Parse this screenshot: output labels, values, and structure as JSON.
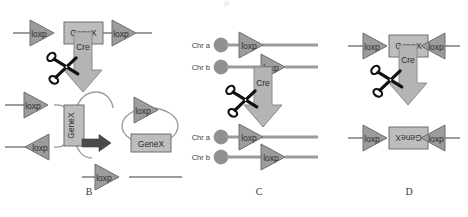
{
  "figure": {
    "colors": {
      "triangle_fill": "#9c9c9c",
      "triangle_stroke": "#6e6e6e",
      "box_fill": "#bdbdbd",
      "box_stroke": "#6e6e6e",
      "arrow_fill": "#b4b4b4",
      "arrow_stroke": "#8a8a8a",
      "dna_line": "#9c9c9c",
      "centromere_fill": "#8f8f8f",
      "thick_arrow_fill": "#4a4a4a",
      "scissors": "#111111",
      "label_text": "#3a3a3a",
      "element_text": "#2e2e2e",
      "circle_outline": "#8a8a8a"
    },
    "top_partial_mark": "µ"
  },
  "panels": [
    {
      "id": "B",
      "label": "B",
      "caption": "B",
      "mechanism": "excision",
      "description": "Two loxP sites in the same orientation on one DNA molecule; Cre excises the intervening GeneX as a circle",
      "substrate": {
        "loxp_left": "loxp",
        "gene": "GeneX",
        "loxp_right": "loxp"
      },
      "enzyme": {
        "name": "Cre",
        "icon": "scissors-icon"
      },
      "products": {
        "synapse_loxp_upper": "loxp",
        "synapse_loxp_lower": "loxp",
        "synapse_gene": "GeneX",
        "circle_loxp": "loxp",
        "circle_gene": "GeneX",
        "residual_loxp": "loxp"
      }
    },
    {
      "id": "C",
      "label": "C",
      "caption": "C",
      "mechanism": "translocation",
      "description": "loxP sites on two different chromosomes; Cre catalyses a reciprocal translocation between Chr a and Chr b",
      "substrate": {
        "chr_a_label": "Chr a",
        "chr_b_label": "Chr b",
        "chr_a_loxp": "loxp",
        "chr_b_loxp": "loxp"
      },
      "enzyme": {
        "name": "Cre",
        "icon": "scissors-icon"
      },
      "products": {
        "chr_a_label": "Chr a",
        "chr_b_label": "Chr b",
        "chr_a_loxp": "loxp",
        "chr_b_loxp": "loxp"
      }
    },
    {
      "id": "D",
      "label": "D",
      "caption": "D",
      "mechanism": "inversion",
      "description": "Two loxP sites in opposite orientation; Cre inverts the intervening GeneX segment",
      "substrate": {
        "loxp_left": "loxp",
        "gene": "GeneX",
        "loxp_right": "loxp"
      },
      "enzyme": {
        "name": "Cre",
        "icon": "scissors-icon"
      },
      "products": {
        "loxp_left": "loxp",
        "gene": "GeneX",
        "loxp_right": "loxp",
        "gene_orientation": "inverted"
      }
    }
  ]
}
